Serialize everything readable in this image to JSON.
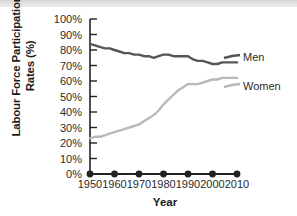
{
  "chart_data": {
    "type": "line",
    "title": "",
    "xlabel": "Year",
    "ylabel": "Labour Force Participation Rates (%)",
    "ylabel_line1": "Labour Force Participation",
    "ylabel_line2": "Rates (%)",
    "xlim": [
      1950,
      2010
    ],
    "ylim": [
      0,
      100
    ],
    "grid": false,
    "legend_position": "right-inline",
    "xtick_labels": [
      "1950",
      "1960",
      "1970",
      "1980",
      "1990",
      "2000",
      "2010"
    ],
    "xticks": [
      1950,
      1960,
      1970,
      1980,
      1990,
      2000,
      2010
    ],
    "ytick_labels": [
      "0%",
      "10%",
      "20%",
      "30%",
      "40%",
      "50%",
      "60%",
      "70%",
      "80%",
      "90%",
      "100%"
    ],
    "yticks": [
      0,
      10,
      20,
      30,
      40,
      50,
      60,
      70,
      80,
      90,
      100
    ],
    "colors": {
      "men": "#565656",
      "women": "#b9b9b9",
      "baseline": "#222222"
    },
    "x": [
      1950,
      1952,
      1954,
      1956,
      1958,
      1960,
      1962,
      1964,
      1966,
      1968,
      1970,
      1972,
      1974,
      1976,
      1978,
      1980,
      1982,
      1984,
      1986,
      1988,
      1990,
      1992,
      1994,
      1996,
      1998,
      2000,
      2002,
      2004,
      2006,
      2008,
      2010
    ],
    "series": [
      {
        "name": "Men",
        "label": "Men",
        "color": "#565656",
        "values": [
          84,
          83,
          82,
          81,
          81,
          80,
          79,
          78,
          78,
          77,
          77,
          76,
          76,
          75,
          76,
          77,
          77,
          76,
          76,
          76,
          76,
          74,
          73,
          73,
          72,
          71,
          71,
          72,
          72,
          72,
          72
        ]
      },
      {
        "name": "Women",
        "label": "Women",
        "color": "#b9b9b9",
        "values": [
          23,
          24,
          24,
          25,
          26,
          27,
          28,
          29,
          30,
          31,
          32,
          34,
          36,
          38,
          41,
          45,
          48,
          51,
          54,
          56,
          58,
          58,
          58,
          59,
          60,
          61,
          61,
          62,
          62,
          62,
          62
        ]
      },
      {
        "name": "Baseline",
        "label": "",
        "color": "#222222",
        "markers": true,
        "marker_x": [
          1950,
          1960,
          1970,
          1980,
          1990,
          2000,
          2010
        ],
        "values": [
          0,
          0,
          0,
          0,
          0,
          0,
          0,
          0,
          0,
          0,
          0,
          0,
          0,
          0,
          0,
          0,
          0,
          0,
          0,
          0,
          0,
          0,
          0,
          0,
          0,
          0,
          0,
          0,
          0,
          0,
          0
        ]
      }
    ]
  }
}
